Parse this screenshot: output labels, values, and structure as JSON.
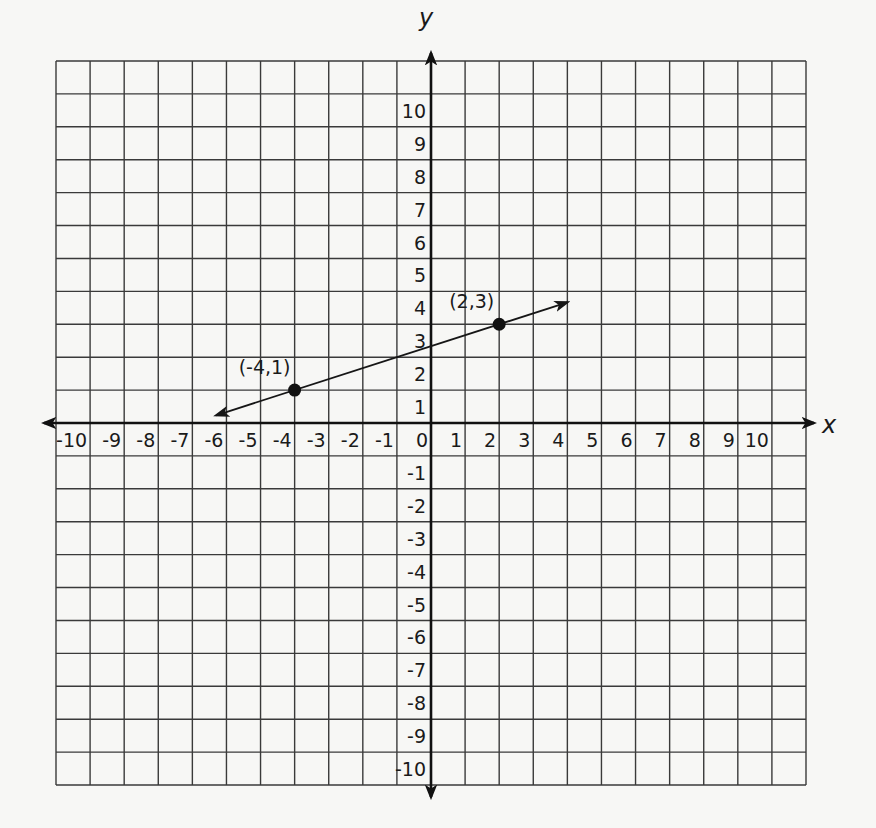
{
  "chart_data": {
    "type": "line",
    "title": "",
    "xlabel": "x",
    "ylabel": "y",
    "xlim": [
      -10,
      10
    ],
    "ylim": [
      -10,
      10
    ],
    "grid": true,
    "x_ticks": [
      -10,
      -9,
      -8,
      -7,
      -6,
      -5,
      -4,
      -3,
      -2,
      -1,
      0,
      1,
      2,
      3,
      4,
      5,
      6,
      7,
      8,
      9,
      10
    ],
    "y_ticks": [
      10,
      9,
      8,
      7,
      6,
      5,
      4,
      3,
      2,
      1,
      -1,
      -2,
      -3,
      -4,
      -5,
      -6,
      -7,
      -8,
      -9,
      -10
    ],
    "series": [
      {
        "name": "line through (-4,1) and (2,3)",
        "points": [
          {
            "x": -4,
            "y": 1,
            "label": "(-4,1)"
          },
          {
            "x": 2,
            "y": 3,
            "label": "(2,3)"
          }
        ],
        "arrows_both_ends": true,
        "extent_x": [
          -6.3,
          4.0
        ]
      }
    ]
  },
  "labels": {
    "x_axis": "x",
    "y_axis": "y",
    "point_a": "(-4,1)",
    "point_b": "(2,3)"
  },
  "colors": {
    "ink": "#161616",
    "grid": "#3a3a3a",
    "paper": "#f7f7f5"
  }
}
